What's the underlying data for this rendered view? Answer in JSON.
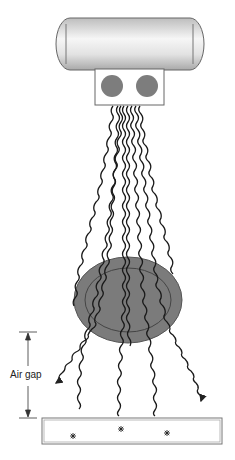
{
  "diagram": {
    "components": {
      "xray_tube": {
        "name": "x-ray-tube"
      },
      "collimator": {
        "name": "collimator-box",
        "apertures": 2
      },
      "patient": {
        "name": "patient-body"
      },
      "detector": {
        "name": "image-receptor"
      }
    },
    "labels": {
      "air_gap": "Air gap"
    },
    "colors": {
      "stroke": "#222222",
      "patient_fill": "#7b7b7b",
      "aperture_fill": "#7d7d7d",
      "tube_light": "#f4f4f4",
      "tube_dark": "#b8b8b8"
    },
    "events": {
      "absorbed_marks": 3,
      "scattered_arrows": 2
    }
  }
}
